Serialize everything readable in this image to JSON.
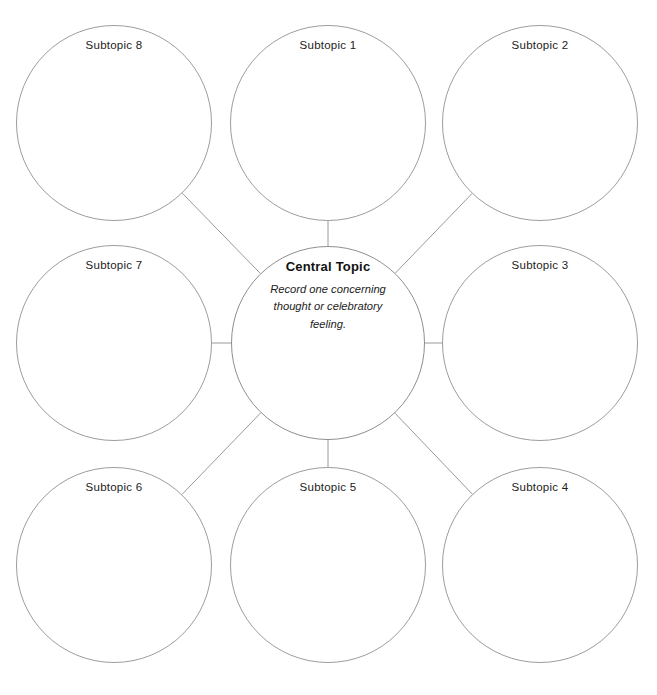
{
  "diagram": {
    "type": "radial-mind-map",
    "background_color": "#ffffff",
    "stroke_color": "#9a9a9a",
    "text_color": "#1c1c1c",
    "central": {
      "title": "Central Topic",
      "description": "Record one concerning thought or celebratory feeling.",
      "cx": 328,
      "cy": 343,
      "r": 97
    },
    "subtopics": [
      {
        "label": "Subtopic 8",
        "cx": 114,
        "cy": 123,
        "r": 98,
        "position": "top-left"
      },
      {
        "label": "Subtopic 1",
        "cx": 328,
        "cy": 123,
        "r": 98,
        "position": "top-center"
      },
      {
        "label": "Subtopic 2",
        "cx": 540,
        "cy": 123,
        "r": 98,
        "position": "top-right"
      },
      {
        "label": "Subtopic 7",
        "cx": 114,
        "cy": 343,
        "r": 98,
        "position": "middle-left"
      },
      {
        "label": "Subtopic 3",
        "cx": 540,
        "cy": 343,
        "r": 98,
        "position": "middle-right"
      },
      {
        "label": "Subtopic 6",
        "cx": 114,
        "cy": 565,
        "r": 98,
        "position": "bottom-left"
      },
      {
        "label": "Subtopic 5",
        "cx": 328,
        "cy": 565,
        "r": 98,
        "position": "bottom-center"
      },
      {
        "label": "Subtopic 4",
        "cx": 540,
        "cy": 565,
        "r": 98,
        "position": "bottom-right"
      }
    ],
    "connectors": [
      {
        "from": "Subtopic 8",
        "to": "Central Topic",
        "kind": "diagonal"
      },
      {
        "from": "Subtopic 1",
        "to": "Central Topic",
        "kind": "vertical"
      },
      {
        "from": "Subtopic 2",
        "to": "Central Topic",
        "kind": "diagonal"
      },
      {
        "from": "Subtopic 7",
        "to": "Central Topic",
        "kind": "horizontal"
      },
      {
        "from": "Subtopic 3",
        "to": "Central Topic",
        "kind": "horizontal"
      },
      {
        "from": "Subtopic 6",
        "to": "Central Topic",
        "kind": "diagonal"
      },
      {
        "from": "Subtopic 5",
        "to": "Central Topic",
        "kind": "vertical"
      },
      {
        "from": "Subtopic 4",
        "to": "Central Topic",
        "kind": "diagonal"
      }
    ]
  }
}
